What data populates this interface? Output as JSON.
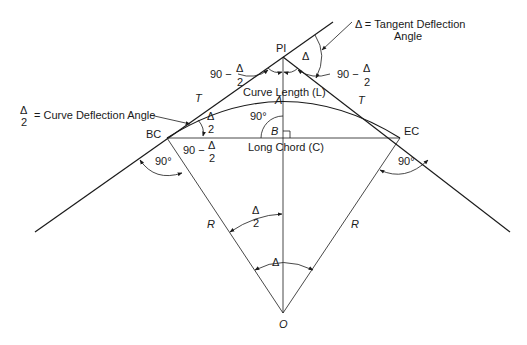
{
  "diagram": {
    "points": {
      "pi": "PI",
      "bc": "BC",
      "ec": "EC",
      "a": "A",
      "b": "B",
      "o": "O"
    },
    "labels": {
      "tangent_deflection": "Δ = Tangent Deflection",
      "tangent_deflection_2": "Angle",
      "curve_deflection_frac_num": "Δ",
      "curve_deflection_frac_den": "2",
      "curve_deflection_text": "= Curve Deflection Angle",
      "curve_length": "Curve Length (L)",
      "long_chord": "Long Chord (C)",
      "tangent_left": "T",
      "tangent_right": "T",
      "radius_left": "R",
      "radius_right": "R",
      "delta": "Δ",
      "delta_top": "Δ",
      "ninety": "90°",
      "ninety_minus": "90 −",
      "frac_num": "Δ",
      "frac_den": "2"
    }
  }
}
